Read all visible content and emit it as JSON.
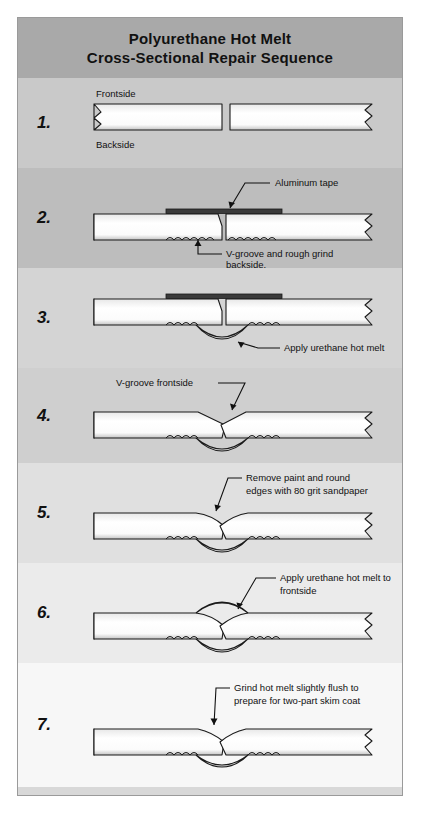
{
  "document": {
    "title_line_1": "Polyurethane Hot Melt",
    "title_line_2": "Cross-Sectional Repair Sequence"
  },
  "colors": {
    "title_band": "#a9a9a9",
    "panel_fill_light": "#ffffff",
    "panel_fill_shadow": "#bdbdbd",
    "tape": "#3a3a3a",
    "outline": "#1a1a1a",
    "border": "#9a9a9a"
  },
  "steps": [
    {
      "number": "1.",
      "labels": {
        "top": "Frontside",
        "bottom": "Backside"
      },
      "callouts": []
    },
    {
      "number": "2.",
      "labels": {},
      "callouts": [
        {
          "text_line_1": "Aluminum tape",
          "text_line_2": ""
        },
        {
          "text_line_1": "V-groove and rough grind",
          "text_line_2": "backside."
        }
      ]
    },
    {
      "number": "3.",
      "labels": {},
      "callouts": [
        {
          "text_line_1": "Apply urethane hot melt",
          "text_line_2": ""
        }
      ]
    },
    {
      "number": "4.",
      "labels": {},
      "callouts": [
        {
          "text_line_1": "V-groove frontside",
          "text_line_2": ""
        }
      ]
    },
    {
      "number": "5.",
      "labels": {},
      "callouts": [
        {
          "text_line_1": "Remove paint and round",
          "text_line_2": "edges with 80 grit sandpaper"
        }
      ]
    },
    {
      "number": "6.",
      "labels": {},
      "callouts": [
        {
          "text_line_1": "Apply urethane hot melt to",
          "text_line_2": "frontside"
        }
      ]
    },
    {
      "number": "7.",
      "labels": {},
      "callouts": [
        {
          "text_line_1": "Grind hot melt slightly flush to",
          "text_line_2": "prepare for two-part skim coat"
        }
      ]
    }
  ]
}
